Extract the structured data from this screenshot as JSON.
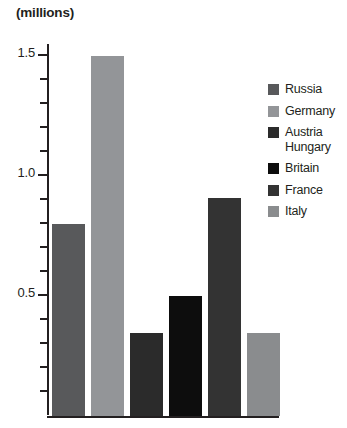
{
  "chart_data": {
    "type": "bar",
    "title": "(millions)",
    "xlabel": "",
    "ylabel": "(millions)",
    "ylim": [
      0,
      1.55
    ],
    "yticks": [
      0.5,
      1.0,
      1.5
    ],
    "ytick_labels": [
      "0.5",
      "1.0",
      "1.5"
    ],
    "minor_tick_step": 0.1,
    "grid": false,
    "legend_position": "right",
    "categories": [
      "Russia",
      "Germany",
      "Austria Hungary",
      "Britain",
      "France",
      "Italy"
    ],
    "values": [
      0.8,
      1.5,
      0.345,
      0.5,
      0.91,
      0.345
    ],
    "series": [
      {
        "name": "Mobilized forces",
        "values": [
          0.8,
          1.5,
          0.345,
          0.5,
          0.91,
          0.345
        ]
      }
    ],
    "bar_colors": [
      "#58595b",
      "#939598",
      "#2b2b2b",
      "#0d0d0d",
      "#333333",
      "#8a8c8e"
    ]
  },
  "title": {
    "text": "(millions)"
  },
  "axis": {
    "ticks": [
      {
        "value": 1.5,
        "label": "1.5",
        "major": true
      },
      {
        "value": 1.4,
        "label": "",
        "major": false
      },
      {
        "value": 1.3,
        "label": "",
        "major": false
      },
      {
        "value": 1.2,
        "label": "",
        "major": false
      },
      {
        "value": 1.1,
        "label": "",
        "major": false
      },
      {
        "value": 1.0,
        "label": "1.0",
        "major": true
      },
      {
        "value": 0.9,
        "label": "",
        "major": false
      },
      {
        "value": 0.8,
        "label": "",
        "major": false
      },
      {
        "value": 0.7,
        "label": "",
        "major": false
      },
      {
        "value": 0.6,
        "label": "",
        "major": false
      },
      {
        "value": 0.5,
        "label": "0.5",
        "major": true
      },
      {
        "value": 0.4,
        "label": "",
        "major": false
      },
      {
        "value": 0.3,
        "label": "",
        "major": false
      },
      {
        "value": 0.2,
        "label": "",
        "major": false
      },
      {
        "value": 0.1,
        "label": "",
        "major": false
      }
    ]
  },
  "bars": [
    {
      "name": "Russia",
      "value": 0.8,
      "color": "#58595b"
    },
    {
      "name": "Germany",
      "value": 1.5,
      "color": "#939598"
    },
    {
      "name": "Austria Hungary",
      "value": 0.345,
      "color": "#2b2b2b"
    },
    {
      "name": "Britain",
      "value": 0.5,
      "color": "#0d0d0d"
    },
    {
      "name": "France",
      "value": 0.91,
      "color": "#333333"
    },
    {
      "name": "Italy",
      "value": 0.345,
      "color": "#8a8c8e"
    }
  ],
  "legend": {
    "items": [
      {
        "label": "Russia",
        "color": "#58595b"
      },
      {
        "label": "Germany",
        "color": "#939598"
      },
      {
        "label": "Austria\nHungary",
        "color": "#2b2b2b"
      },
      {
        "label": "Britain",
        "color": "#0d0d0d"
      },
      {
        "label": "France",
        "color": "#333333"
      },
      {
        "label": "Italy",
        "color": "#8a8c8e"
      }
    ]
  }
}
